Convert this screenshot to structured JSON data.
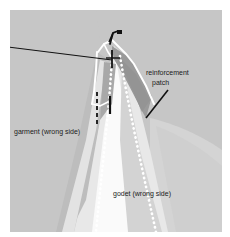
{
  "figure": {
    "name": "godet-insertion-diagram",
    "canvas": {
      "width": 230,
      "height": 237
    },
    "page_background": "#ffffff",
    "panel": {
      "x": 10,
      "y": 10,
      "width": 212,
      "height": 222,
      "fill": "#c6c6c6"
    }
  },
  "palette": {
    "page": "#ffffff",
    "garment_gray": "#c6c6c6",
    "garment_shadow": "#b9b9b9",
    "patch_dark": "#9a9a9a",
    "godet_light": "#f1f1f1",
    "godet_mid": "#d9d9d9",
    "godet_white": "#fafafa",
    "stitch_white": "#ffffff",
    "outline_white": "#ffffff",
    "ink_black": "#111111",
    "label_text": "#1a1a1a"
  },
  "labels": {
    "reinforcement": "reinforcement",
    "patch": "patch",
    "garment": "garment (wrong side)",
    "godet": "godet (wrong side)"
  },
  "label_positions": {
    "reinforcement": {
      "x": 146,
      "y": 75
    },
    "patch": {
      "x": 152,
      "y": 85
    },
    "garment": {
      "x": 14,
      "y": 134
    },
    "godet": {
      "x": 113,
      "y": 196
    }
  },
  "annotations": {
    "leader_left": {
      "from_x": 0,
      "from_y": 46,
      "to_x": 112,
      "to_y": 60
    },
    "leader_patch": {
      "from_x": 168,
      "from_y": 90,
      "to_x": 146,
      "to_y": 118
    },
    "pin_label": "pin-marker",
    "basting_label": "basting-stitch-marks",
    "stitch_line_label": "dotted-stitch-line"
  },
  "elements": {
    "pin": {
      "name": "pin-icon",
      "x": 112,
      "y": 30
    },
    "seam_marks": [
      {
        "name": "basting-dash-left",
        "x": 97,
        "y": 100
      },
      {
        "name": "seam-tick-center",
        "x": 110,
        "y": 102
      },
      {
        "name": "seam-tick-apex",
        "x": 112,
        "y": 57
      }
    ]
  }
}
